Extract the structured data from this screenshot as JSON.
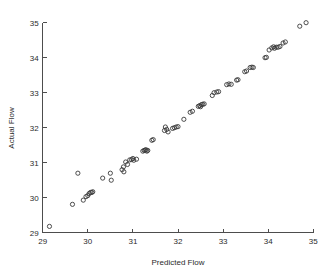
{
  "chart_data": {
    "type": "scatter",
    "title": "",
    "xlabel": "Predicted Flow",
    "ylabel": "Actual Flow",
    "xlim": [
      29,
      35
    ],
    "ylim": [
      29,
      35
    ],
    "xticks": [
      29,
      30,
      31,
      32,
      33,
      34,
      35
    ],
    "yticks": [
      29,
      30,
      31,
      32,
      33,
      34,
      35
    ],
    "xticklabels": [
      "29",
      "30",
      "31",
      "32",
      "33",
      "34",
      "35"
    ],
    "yticklabels": [
      "29",
      "30",
      "31",
      "32",
      "33",
      "34",
      "35"
    ],
    "grid": false,
    "legend": null,
    "marker": "open-circle",
    "marker_color": "#3a3a3a",
    "marker_size": 4.2,
    "series": [
      {
        "name": "flow",
        "points": [
          [
            29.15,
            29.18
          ],
          [
            29.66,
            29.81
          ],
          [
            29.78,
            30.7
          ],
          [
            29.9,
            29.93
          ],
          [
            29.96,
            30.03
          ],
          [
            30.0,
            30.06
          ],
          [
            30.03,
            30.12
          ],
          [
            30.06,
            30.15
          ],
          [
            30.09,
            30.15
          ],
          [
            30.11,
            30.17
          ],
          [
            30.33,
            30.56
          ],
          [
            30.5,
            30.7
          ],
          [
            30.52,
            30.5
          ],
          [
            30.76,
            30.8
          ],
          [
            30.79,
            30.88
          ],
          [
            30.8,
            30.74
          ],
          [
            30.84,
            31.02
          ],
          [
            30.88,
            30.95
          ],
          [
            30.93,
            31.08
          ],
          [
            30.97,
            31.09
          ],
          [
            31.0,
            31.12
          ],
          [
            31.02,
            31.07
          ],
          [
            31.08,
            31.1
          ],
          [
            31.22,
            31.33
          ],
          [
            31.25,
            31.35
          ],
          [
            31.27,
            31.36
          ],
          [
            31.29,
            31.37
          ],
          [
            31.31,
            31.33
          ],
          [
            31.33,
            31.35
          ],
          [
            31.42,
            31.64
          ],
          [
            31.45,
            31.66
          ],
          [
            31.7,
            31.92
          ],
          [
            31.72,
            32.02
          ],
          [
            31.75,
            31.95
          ],
          [
            31.78,
            31.88
          ],
          [
            31.88,
            31.98
          ],
          [
            31.92,
            32.0
          ],
          [
            31.96,
            32.02
          ],
          [
            32.0,
            32.03
          ],
          [
            32.13,
            32.24
          ],
          [
            32.27,
            32.44
          ],
          [
            32.32,
            32.47
          ],
          [
            32.45,
            32.61
          ],
          [
            32.48,
            32.63
          ],
          [
            32.5,
            32.6
          ],
          [
            32.52,
            32.66
          ],
          [
            32.55,
            32.67
          ],
          [
            32.58,
            32.68
          ],
          [
            32.76,
            32.92
          ],
          [
            32.8,
            33.0
          ],
          [
            32.86,
            33.02
          ],
          [
            32.9,
            33.03
          ],
          [
            33.08,
            33.23
          ],
          [
            33.13,
            33.25
          ],
          [
            33.18,
            33.24
          ],
          [
            33.3,
            33.36
          ],
          [
            33.33,
            33.37
          ],
          [
            33.48,
            33.6
          ],
          [
            33.52,
            33.62
          ],
          [
            33.6,
            33.72
          ],
          [
            33.64,
            33.73
          ],
          [
            33.67,
            33.72
          ],
          [
            33.93,
            34.0
          ],
          [
            33.96,
            34.01
          ],
          [
            34.02,
            34.22
          ],
          [
            34.08,
            34.28
          ],
          [
            34.12,
            34.31
          ],
          [
            34.14,
            34.27
          ],
          [
            34.18,
            34.3
          ],
          [
            34.22,
            34.3
          ],
          [
            34.26,
            34.32
          ],
          [
            34.33,
            34.42
          ],
          [
            34.38,
            34.45
          ],
          [
            34.7,
            34.9
          ],
          [
            34.84,
            35.0
          ]
        ]
      }
    ]
  },
  "axes": {
    "x_title": "Predicted Flow",
    "y_title": "Actual Flow"
  }
}
